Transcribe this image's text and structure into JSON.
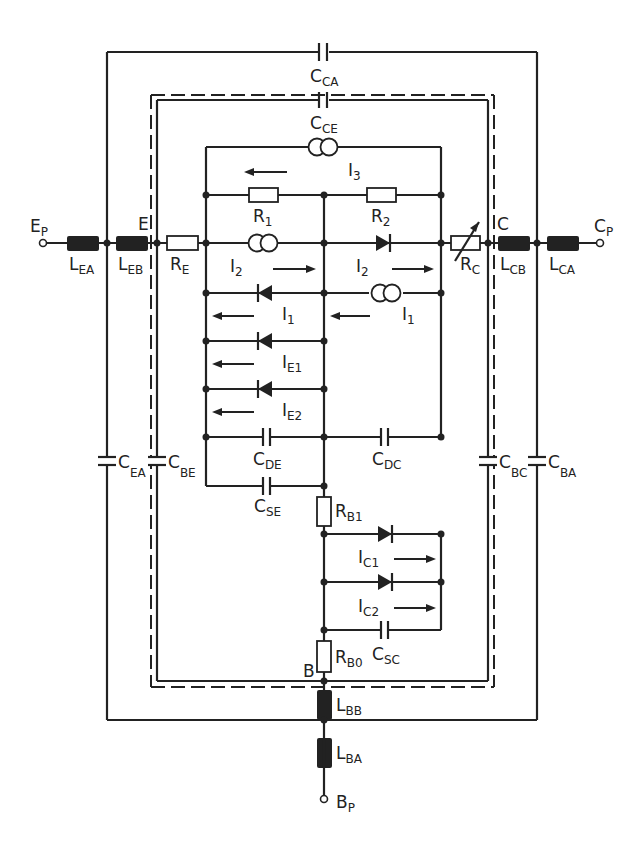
{
  "diagram": {
    "terminals": {
      "emitter_package": {
        "main": "E",
        "sub": "P"
      },
      "collector_package": {
        "main": "C",
        "sub": "P"
      },
      "base_package": {
        "main": "B",
        "sub": "P"
      },
      "emitter_internal": "E",
      "collector_internal": "C",
      "base_internal": "B"
    },
    "capacitors": {
      "c_ca": {
        "main": "C",
        "sub": "CA"
      },
      "c_ce": {
        "main": "C",
        "sub": "CE"
      },
      "c_ea": {
        "main": "C",
        "sub": "EA"
      },
      "c_be": {
        "main": "C",
        "sub": "BE"
      },
      "c_bc": {
        "main": "C",
        "sub": "BC"
      },
      "c_ba": {
        "main": "C",
        "sub": "BA"
      },
      "c_de": {
        "main": "C",
        "sub": "DE"
      },
      "c_dc": {
        "main": "C",
        "sub": "DC"
      },
      "c_se": {
        "main": "C",
        "sub": "SE"
      },
      "c_sc": {
        "main": "C",
        "sub": "SC"
      }
    },
    "inductors": {
      "l_ea": {
        "main": "L",
        "sub": "EA"
      },
      "l_eb": {
        "main": "L",
        "sub": "EB"
      },
      "l_cb": {
        "main": "L",
        "sub": "CB"
      },
      "l_ca": {
        "main": "L",
        "sub": "CA"
      },
      "l_bb": {
        "main": "L",
        "sub": "BB"
      },
      "l_ba": {
        "main": "L",
        "sub": "BA"
      }
    },
    "resistors": {
      "r_1": {
        "main": "R",
        "sub": "1"
      },
      "r_2": {
        "main": "R",
        "sub": "2"
      },
      "r_e": {
        "main": "R",
        "sub": "E"
      },
      "r_c": {
        "main": "R",
        "sub": "C"
      },
      "r_b1": {
        "main": "R",
        "sub": "B1"
      },
      "r_b0": {
        "main": "R",
        "sub": "B0"
      }
    },
    "currents": {
      "i_3": {
        "main": "I",
        "sub": "3"
      },
      "i_2_left": {
        "main": "I",
        "sub": "2"
      },
      "i_2_right": {
        "main": "I",
        "sub": "2"
      },
      "i_1_left": {
        "main": "I",
        "sub": "1"
      },
      "i_1_right": {
        "main": "I",
        "sub": "1"
      },
      "i_e1": {
        "main": "I",
        "sub": "E1"
      },
      "i_e2": {
        "main": "I",
        "sub": "E2"
      },
      "i_c1": {
        "main": "I",
        "sub": "C1"
      },
      "i_c2": {
        "main": "I",
        "sub": "C2"
      }
    },
    "colors": {
      "ink": "#222222",
      "background": "#ffffff"
    }
  }
}
